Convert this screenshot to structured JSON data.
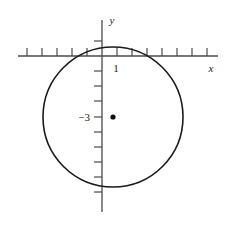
{
  "figure": {
    "kind": "cartesian-plane-with-circle",
    "background_color": "#ffffff",
    "ink_color": "#1a1a1a",
    "axis_color": "#4a4a4a"
  },
  "axes": {
    "x_axis_label": "x",
    "y_axis_label": "y",
    "x_tick_label": "1",
    "y_tick_label": "−3",
    "grid": false
  },
  "chart_data": {
    "type": "scatter",
    "title": "",
    "xlabel": "x",
    "ylabel": "y",
    "grid": false,
    "legend": "none",
    "unit_px": 15,
    "origin_px": {
      "x": 102,
      "y": 56
    },
    "xlim": [
      -5.8,
      8.5
    ],
    "ylim": [
      -11.3,
      2.4
    ],
    "x_ticks": [
      -5,
      -4,
      -3,
      -2,
      -1,
      1,
      2,
      3,
      4,
      5,
      6,
      7
    ],
    "y_ticks": [
      -1,
      -2,
      -3,
      -4,
      -5,
      -6,
      -7,
      -8,
      -9
    ],
    "labeled_x_ticks": [
      {
        "value": 1,
        "label": "1"
      }
    ],
    "labeled_y_ticks": [
      {
        "value": -3,
        "label": "−3"
      }
    ],
    "shapes": [
      {
        "type": "circle",
        "center": [
          1,
          -3
        ],
        "radius": 4.7,
        "center_px": [
          113,
          117
        ],
        "radius_px": 70,
        "stroke": "#1a1a1a",
        "stroke_width": 1.6,
        "fill": "none"
      }
    ],
    "points": [
      {
        "name": "circle-center",
        "x": 1,
        "y": -3,
        "px": [
          113,
          117
        ],
        "marker": "filled-dot",
        "radius_px": 2.6,
        "color": "#111111"
      }
    ]
  }
}
